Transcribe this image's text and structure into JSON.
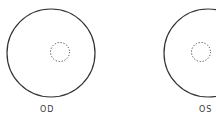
{
  "diagram": {
    "eyes": [
      {
        "label": "OD",
        "outer_circle": {
          "cx": 51,
          "cy": 53,
          "r": 44
        },
        "dotted_circle": {
          "cx": 60,
          "cy": 52,
          "r": 10
        }
      },
      {
        "label": "OS",
        "outer_circle": {
          "cx": 208,
          "cy": 53,
          "r": 44
        },
        "dotted_circle": {
          "cx": 201,
          "cy": 52,
          "r": 10
        }
      }
    ],
    "colors": {
      "stroke": "#333333",
      "text": "#3a3a3a"
    }
  }
}
